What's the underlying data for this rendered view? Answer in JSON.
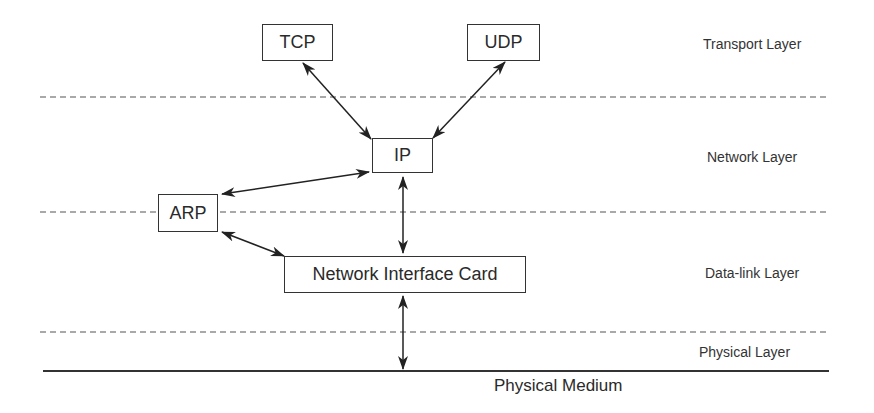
{
  "boxes": {
    "tcp": "TCP",
    "udp": "UDP",
    "ip": "IP",
    "arp": "ARP",
    "nic": "Network Interface Card"
  },
  "layers": {
    "transport": "Transport Layer",
    "network": "Network Layer",
    "datalink": "Data-link Layer",
    "physical": "Physical Layer"
  },
  "medium": "Physical Medium",
  "colors": {
    "line": "#333333",
    "dashed": "#555555",
    "text": "#2a2a2a"
  }
}
